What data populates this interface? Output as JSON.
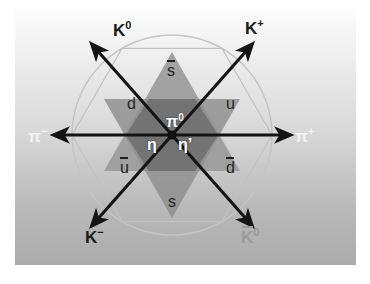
{
  "figure": {
    "background_top": "#fdfdfd",
    "background_bottom": "#ababab",
    "circle_color": "#c9c9c9"
  },
  "diagram": {
    "type": "weight-diagram",
    "shape": "hexagram",
    "triangle_up_color": "#9e9e9e",
    "triangle_down_color": "#8a8a8a",
    "overlap_color": "#6f6f6f",
    "arrow_color": "#141414",
    "arrow_count": 6
  },
  "mesons": [
    {
      "id": "k-zero",
      "label": "K",
      "sup": "0",
      "pos": "top-left",
      "tone": "dark"
    },
    {
      "id": "k-plus",
      "label": "K",
      "sup": "+",
      "pos": "top-right",
      "tone": "dark"
    },
    {
      "id": "pi-minus",
      "label": "π",
      "sup": "−",
      "pos": "left",
      "tone": "light"
    },
    {
      "id": "pi-plus",
      "label": "π",
      "sup": "+",
      "pos": "right",
      "tone": "light"
    },
    {
      "id": "k-minus",
      "label": "K",
      "sup": "−",
      "pos": "bottom-left",
      "tone": "dark"
    },
    {
      "id": "k-zero-bar",
      "label": "K",
      "sup": "0",
      "pos": "bottom-right",
      "tone": "faint",
      "bar": true
    }
  ],
  "quarks": [
    {
      "id": "s-bar",
      "label": "s",
      "bar": true,
      "pos": "top"
    },
    {
      "id": "d",
      "label": "d",
      "bar": false,
      "pos": "upper-left"
    },
    {
      "id": "u",
      "label": "u",
      "bar": false,
      "pos": "upper-right"
    },
    {
      "id": "u-bar",
      "label": "u",
      "bar": true,
      "pos": "lower-left"
    },
    {
      "id": "d-bar",
      "label": "d",
      "bar": true,
      "pos": "lower-right"
    },
    {
      "id": "s",
      "label": "s",
      "bar": false,
      "pos": "bottom"
    }
  ],
  "center": {
    "pi_zero": "π",
    "pi_zero_sup": "0",
    "eta": "η",
    "eta_prime": "η’"
  }
}
